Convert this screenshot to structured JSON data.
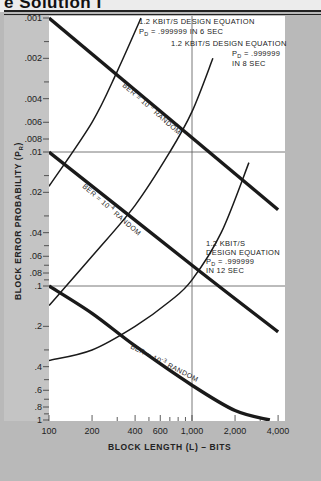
{
  "header": {
    "title": "e Solution I"
  },
  "chart_data": {
    "type": "line",
    "title": "",
    "xlabel": "BLOCK LENGTH (L) – BITS",
    "ylabel": "BLOCK ERROR PROBABILITY (P_R)",
    "xscale": "log",
    "yscale": "log",
    "xlim": [
      100,
      4000
    ],
    "ylim": [
      0.001,
      1
    ],
    "y_inverted": true,
    "x_ticks": [
      "100",
      "200",
      "400",
      "600",
      "1,000",
      "2,000",
      "4,000"
    ],
    "y_ticks": [
      ".001",
      ".002",
      ".004",
      ".006",
      ".008",
      ".01",
      ".02",
      ".04",
      ".06",
      ".08",
      ".1",
      ".2",
      ".4",
      ".6",
      ".8",
      "1"
    ],
    "reference_lines": [
      {
        "orientation": "vertical",
        "x": 1000
      },
      {
        "orientation": "horizontal",
        "y": 0.01
      },
      {
        "orientation": "horizontal",
        "y": 0.1
      }
    ],
    "series": [
      {
        "name": "BER = 10^-5 RANDOM",
        "style": "thick",
        "points": [
          [
            100,
            0.001
          ],
          [
            4000,
            0.027
          ]
        ]
      },
      {
        "name": "BER = 10^-4 RANDOM",
        "style": "thick",
        "points": [
          [
            100,
            0.01
          ],
          [
            1000,
            0.07
          ],
          [
            4000,
            0.22
          ]
        ]
      },
      {
        "name": "BER = 10^-3 RANDOM",
        "style": "thick",
        "points": [
          [
            100,
            0.1
          ],
          [
            200,
            0.16
          ],
          [
            400,
            0.28
          ],
          [
            1000,
            0.55
          ],
          [
            2000,
            0.85
          ],
          [
            3500,
            1.0
          ]
        ]
      },
      {
        "name": "1.2 KBIT/S DESIGN EQUATION P_D = .999999 IN 6 SEC",
        "style": "thin",
        "points": [
          [
            100,
            0.018
          ],
          [
            200,
            0.006
          ],
          [
            300,
            0.0025
          ],
          [
            440,
            0.001
          ]
        ]
      },
      {
        "name": "1.2 KBIT/S DESIGN EQUATION P_D = .999999 IN 8 SEC",
        "style": "thin",
        "points": [
          [
            100,
            0.14
          ],
          [
            200,
            0.06
          ],
          [
            400,
            0.025
          ],
          [
            700,
            0.01
          ],
          [
            1000,
            0.005
          ],
          [
            1400,
            0.002
          ]
        ]
      },
      {
        "name": "1.2 KBIT/S DESIGN EQUATION P_D = .999999 IN 12 SEC",
        "style": "thin",
        "points": [
          [
            100,
            0.36
          ],
          [
            200,
            0.3
          ],
          [
            400,
            0.2
          ],
          [
            700,
            0.13
          ],
          [
            1000,
            0.09
          ],
          [
            1600,
            0.04
          ],
          [
            2500,
            0.012
          ]
        ]
      }
    ],
    "annotations": [
      {
        "lines": [
          "1.2 KBIT/S DESIGN EQUATION",
          "P_D = .999999 IN 6 SEC"
        ]
      },
      {
        "lines": [
          "1.2 KBIT/S DESIGN EQUATION",
          "P_D = .999999",
          "IN 8 SEC"
        ]
      },
      {
        "lines": [
          "1.2 KBIT/S",
          "DESIGN EQUATION",
          "P_D = .999999",
          "IN 12 SEC"
        ]
      }
    ]
  },
  "labels": {
    "ber5": "BER = 10",
    "ber5_exp": "-5",
    "ber4": "BER = 10",
    "ber4_exp": "-4",
    "ber3": "BER = 10",
    "ber3_exp": "-3",
    "random": " RANDOM",
    "a6_l1": "1.2 KBIT/S DESIGN EQUATION",
    "a6_l2a": "P",
    "a6_l2sub": "D",
    "a6_l2b": " = .999999 IN 6 SEC",
    "a8_l1": "1.2 KBIT/S DESIGN EQUATION",
    "a8_l2a": "P",
    "a8_l2sub": "D",
    "a8_l2b": " = .999999",
    "a8_l3": "IN 8 SEC",
    "a12_l1": "1.2 KBIT/S",
    "a12_l2": "DESIGN EQUATION",
    "a12_l3a": "P",
    "a12_l3sub": "D",
    "a12_l3b": " = .999999",
    "a12_l4": "IN 12 SEC",
    "ylabel_main": "BLOCK ERROR PROBABILITY (P",
    "ylabel_sub": "R",
    "ylabel_end": ")",
    "xlabel": "BLOCK LENGTH (L) – BITS"
  }
}
